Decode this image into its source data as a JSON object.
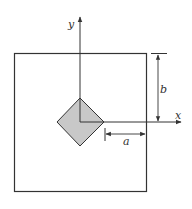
{
  "labels": {
    "y_axis": "y",
    "x_axis": "x",
    "dim_b": "b",
    "dim_a": "a"
  },
  "colors": {
    "line": "#333333",
    "diamond_fill": "#c8c8c8",
    "background": "#ffffff"
  }
}
